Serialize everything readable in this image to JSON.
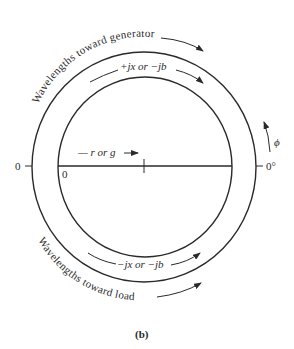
{
  "figure": {
    "caption": "(b)",
    "colors": {
      "line": "#2a2a2a",
      "background": "#ffffff"
    },
    "outer_arc_top_label": "Wavelengths toward generator",
    "outer_arc_bottom_label": "Wavelengths toward load",
    "inner_top_label": "+jx or −jb",
    "inner_bottom_label": "−jx or −jb",
    "axis_label": "— r or g",
    "inner_zero_label": "0",
    "left_zero_label": "0",
    "right_angle_label": "0°",
    "angle_symbol": "ϕ"
  }
}
